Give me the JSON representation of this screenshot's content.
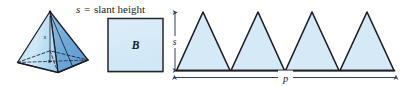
{
  "figure": {
    "caption_text": {
      "variable": "s",
      "equals": "=",
      "definition": "slant height",
      "full": "s = slant height"
    },
    "base_square_label": "B",
    "slant_height_label": "s",
    "perimeter_label": "p",
    "parts": [
      {
        "name": "square-pyramid",
        "description": "square pyramid solid with dashed hidden base edges and height line"
      },
      {
        "name": "base-square",
        "description": "square labeled B representing the base area"
      },
      {
        "name": "lateral-triangles",
        "description": "four congruent lateral face triangles unfolded in a row",
        "triangle_count": 4
      }
    ],
    "dimensions": {
      "slant_height_measure": "s",
      "base_perimeter_measure": "p"
    }
  },
  "colors": {
    "fill_light_blue": "#d5e9f7",
    "fill_mid_blue": "#9ccbe8",
    "fill_dark_blue": "#6fa8d8",
    "outline_dark": "#1c1c26",
    "outline_navy": "#2b3a52",
    "arrow_navy": "#30415c",
    "base_shadow": "#8a8f63",
    "text_color": "#1a1a1a",
    "page_background": "#ffffff"
  }
}
